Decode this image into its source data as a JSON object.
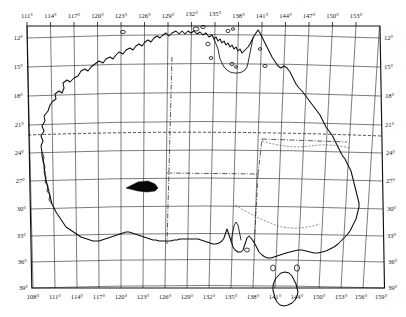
{
  "map": {
    "title": "Map of Australia with latitude and longitude graticule",
    "region": "Australia",
    "projection": "conic",
    "axes": {
      "longitude_top": [
        "111°",
        "114°",
        "117°",
        "120°",
        "123°",
        "126°",
        "129°",
        "132°",
        "135°",
        "138°",
        "141°",
        "144°",
        "147°",
        "150°",
        "153°"
      ],
      "longitude_bottom": [
        "108°",
        "111°",
        "114°",
        "117°",
        "120°",
        "123°",
        "126°",
        "129°",
        "132°",
        "135°",
        "138°",
        "141°",
        "144°",
        "150°",
        "153°",
        "156°",
        "159°"
      ],
      "latitude_left": [
        "12°",
        "15°",
        "18°",
        "21°",
        "24°",
        "27°",
        "30°",
        "33°",
        "36°",
        "39°"
      ],
      "latitude_right": [
        "12°",
        "15°",
        "18°",
        "21°",
        "24°",
        "27°",
        "30°",
        "33°",
        "36°",
        "39°"
      ]
    },
    "features": {
      "tropic_line_label": "Tropic of Capricorn",
      "state_border_label": "state boundary",
      "marker_label": "shaded study area"
    },
    "colors": {
      "background": "#ffffff",
      "coastline": "#0c0c0c",
      "graticule": "#2b2b2b",
      "frame": "#111111",
      "marker": "#070707"
    }
  }
}
